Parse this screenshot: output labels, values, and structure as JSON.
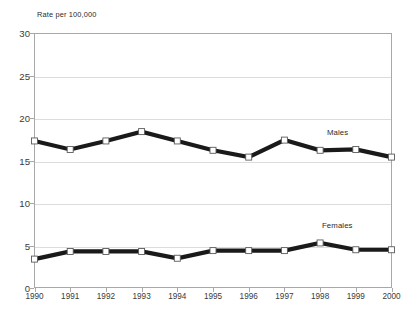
{
  "chart_data": {
    "type": "line",
    "title": "Rate per 100,000",
    "xlabel": "",
    "ylabel": "",
    "ylim": [
      0,
      30
    ],
    "yticks": [
      0,
      5,
      10,
      15,
      20,
      25,
      30
    ],
    "grid": true,
    "legend_position": "inline-right",
    "categories": [
      "1990",
      "1991",
      "1992",
      "1993",
      "1994",
      "1995",
      "1996",
      "1997",
      "1998",
      "1999",
      "2000"
    ],
    "series": [
      {
        "name": "Males",
        "color": "#1a1a1a",
        "values": [
          17.3,
          16.3,
          17.3,
          18.4,
          17.3,
          16.2,
          15.4,
          17.4,
          16.2,
          16.3,
          15.4
        ]
      },
      {
        "name": "Females",
        "color": "#1a1a1a",
        "values": [
          3.4,
          4.3,
          4.3,
          4.3,
          3.5,
          4.4,
          4.4,
          4.4,
          5.3,
          4.5,
          4.5
        ]
      }
    ]
  },
  "axis": {
    "y_tick_labels": [
      "30",
      "25",
      "20",
      "15",
      "10",
      "5",
      "0"
    ],
    "x_tick_labels": [
      "1990",
      "1991",
      "1992",
      "1993",
      "1994",
      "1995",
      "1996",
      "1997",
      "1998",
      "1999",
      "2000"
    ]
  },
  "labels": {
    "males": "Males",
    "females": "Females"
  },
  "colors": {
    "series_stroke": "#1a1a1a",
    "marker_fill": "#ffffff",
    "marker_stroke": "#5a5a5a",
    "gridline": "#dcdcdc",
    "frame": "#a8a8a8",
    "text": "#2b2b2b",
    "background": "#ffffff"
  }
}
